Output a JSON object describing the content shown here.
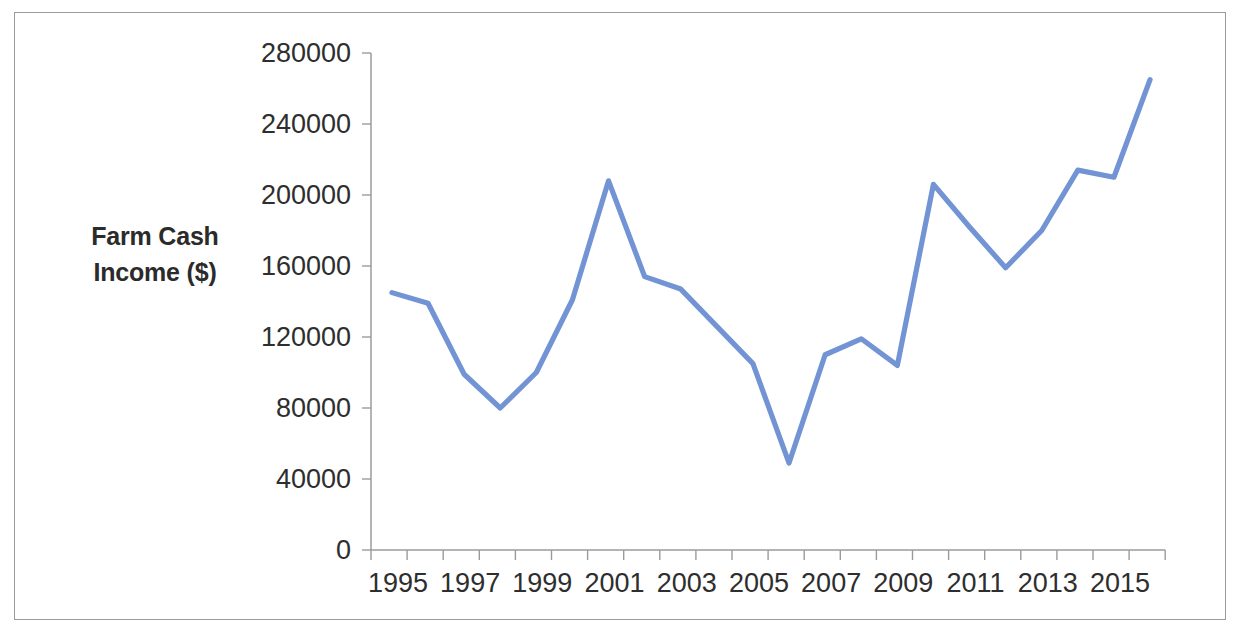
{
  "chart_data": {
    "type": "line",
    "title": "",
    "xlabel": "",
    "ylabel": "Farm Cash Income ($)",
    "x": [
      1995,
      1996,
      1997,
      1998,
      1999,
      2000,
      2001,
      2002,
      2003,
      2004,
      2005,
      2006,
      2007,
      2008,
      2009,
      2010,
      2011,
      2012,
      2013,
      2014,
      2015,
      2016
    ],
    "values": [
      145000,
      139000,
      99000,
      80000,
      100000,
      141000,
      208000,
      154000,
      147000,
      126000,
      105000,
      49000,
      110000,
      119000,
      104000,
      206000,
      182000,
      159000,
      180000,
      214000,
      210000,
      265000
    ],
    "series": [
      {
        "name": "Farm Cash Income ($)",
        "values": [
          145000,
          139000,
          99000,
          80000,
          100000,
          141000,
          208000,
          154000,
          147000,
          126000,
          105000,
          49000,
          110000,
          119000,
          104000,
          206000,
          182000,
          159000,
          180000,
          214000,
          210000,
          265000
        ],
        "color": "#7294d4"
      }
    ],
    "x_tick_labels": [
      "1995",
      "",
      "1997",
      "",
      "1999",
      "",
      "2001",
      "",
      "2003",
      "",
      "2005",
      "",
      "2007",
      "",
      "2009",
      "",
      "2011",
      "",
      "2013",
      "",
      "2015",
      ""
    ],
    "x_tick_labels_shown": [
      "1995",
      "1997",
      "1999",
      "2001",
      "2003",
      "2005",
      "2007",
      "2009",
      "2011",
      "2013",
      "2015"
    ],
    "y_tick_labels": [
      "0",
      "40000",
      "80000",
      "120000",
      "160000",
      "200000",
      "240000",
      "280000"
    ],
    "y_ticks": [
      0,
      40000,
      80000,
      120000,
      160000,
      200000,
      240000,
      280000
    ],
    "ylim": [
      0,
      280000
    ],
    "grid": false,
    "legend": false,
    "legend_position": "none",
    "line_color": "#7294d4",
    "axis_color": "#9b9b9b",
    "text_color": "#2e2e2e",
    "background": "#ffffff",
    "border_color": "#9a9a9a"
  },
  "axis": {
    "y_title_line1": "Farm Cash",
    "y_title_line2": "Income ($)"
  }
}
